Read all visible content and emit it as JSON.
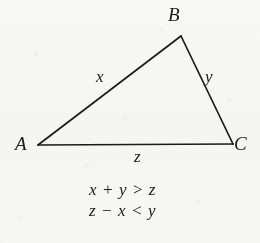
{
  "figure": {
    "kind": "geometry-diagram",
    "shape": "triangle",
    "stroke_color": "#1b1b1b",
    "background_color": "#fbfbfa"
  },
  "vertices": [
    {
      "label": "A",
      "x": 38,
      "y": 145
    },
    {
      "label": "B",
      "x": 181,
      "y": 36
    },
    {
      "label": "C",
      "x": 233,
      "y": 144
    }
  ],
  "sides": [
    {
      "label": "x",
      "from": "A",
      "to": "B"
    },
    {
      "label": "y",
      "from": "B",
      "to": "C"
    },
    {
      "label": "z",
      "from": "A",
      "to": "C"
    }
  ],
  "equations": [
    "x + y > z",
    "z − x < y"
  ]
}
